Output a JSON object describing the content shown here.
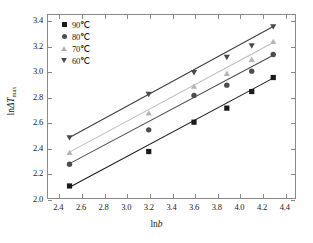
{
  "chart_data": {
    "type": "scatter",
    "title": "",
    "xlabel": "lnb",
    "ylabel": "lnΔT max",
    "xlim": [
      2.3,
      4.5
    ],
    "ylim": [
      2.0,
      3.45
    ],
    "xticks": [
      "2.4",
      "2.6",
      "2.8",
      "3.0",
      "3.2",
      "3.4",
      "3.6",
      "3.8",
      "4.0",
      "4.2",
      "4.4"
    ],
    "xtick_values": [
      2.4,
      2.6,
      2.8,
      3.0,
      3.2,
      3.4,
      3.6,
      3.8,
      4.0,
      4.2,
      4.4
    ],
    "yticks": [
      "2.0",
      "2.2",
      "2.4",
      "2.6",
      "2.8",
      "3.0",
      "3.2",
      "3.4"
    ],
    "ytick_values": [
      2.0,
      2.2,
      2.4,
      2.6,
      2.8,
      3.0,
      3.2,
      3.4
    ],
    "grid": false,
    "legend_position": "top-left",
    "x": [
      2.49,
      3.19,
      3.59,
      3.88,
      4.1,
      4.29
    ],
    "series": [
      {
        "name": "90℃",
        "marker": "square",
        "color": "#1a1a1a",
        "line_color": "#1a1a1a",
        "values": [
          2.11,
          2.38,
          2.61,
          2.72,
          2.85,
          2.96
        ],
        "fit_endpoints": {
          "x0": 2.49,
          "y0": 2.1,
          "x1": 4.29,
          "y1": 2.955
        }
      },
      {
        "name": "80℃",
        "marker": "circle",
        "color": "#4d4d4d",
        "line_color": "#4d4d4d",
        "values": [
          2.28,
          2.55,
          2.82,
          2.9,
          3.01,
          3.14
        ],
        "fit_endpoints": {
          "x0": 2.49,
          "y0": 2.285,
          "x1": 4.29,
          "y1": 3.135
        }
      },
      {
        "name": "70℃",
        "marker": "triangle-up",
        "color": "#b5b5b5",
        "line_color": "#bdbdbd",
        "values": [
          2.37,
          2.68,
          2.89,
          2.99,
          3.1,
          3.24
        ],
        "fit_endpoints": {
          "x0": 2.49,
          "y0": 2.375,
          "x1": 4.29,
          "y1": 3.235
        }
      },
      {
        "name": "60℃",
        "marker": "triangle-down",
        "color": "#4a4a4a",
        "line_color": "#3d3d3d",
        "values": [
          2.49,
          2.83,
          3.0,
          3.12,
          3.21,
          3.36
        ],
        "fit_endpoints": {
          "x0": 2.49,
          "y0": 2.49,
          "x1": 4.29,
          "y1": 3.36
        }
      }
    ]
  },
  "legend": {
    "items": [
      {
        "label": "90℃",
        "marker": "square",
        "color": "#1a1a1a"
      },
      {
        "label": "80℃",
        "marker": "circle",
        "color": "#4d4d4d"
      },
      {
        "label": "70℃",
        "marker": "triangle-up",
        "color": "#b5b5b5"
      },
      {
        "label": "60℃",
        "marker": "triangle-down",
        "color": "#4a4a4a"
      }
    ]
  },
  "axis_titles": {
    "x_prefix": "ln",
    "x_italic": "b",
    "y_prefix": "ln",
    "y_italic": "ΔT",
    "y_sub": "max"
  }
}
